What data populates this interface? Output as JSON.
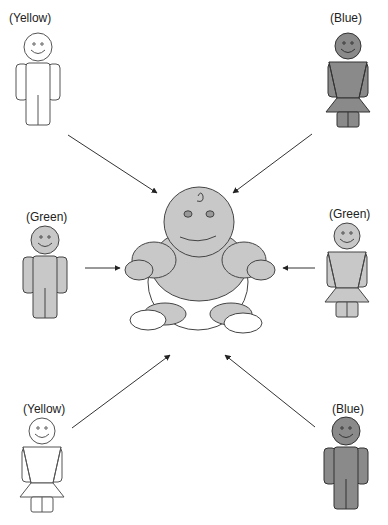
{
  "diagram": {
    "center": {
      "name": "baby",
      "description": "Central baby figure (gray)"
    },
    "figures": [
      {
        "id": "top-left",
        "label": "(Yellow)",
        "type": "male",
        "fill": "#ffffff"
      },
      {
        "id": "top-right",
        "label": "(Blue)",
        "type": "female",
        "fill": "#8a8a8a"
      },
      {
        "id": "mid-left",
        "label": "(Green)",
        "type": "male",
        "fill": "#c8c8c8"
      },
      {
        "id": "mid-right",
        "label": "(Green)",
        "type": "female",
        "fill": "#c8c8c8"
      },
      {
        "id": "bottom-left",
        "label": "(Yellow)",
        "type": "female",
        "fill": "#ffffff"
      },
      {
        "id": "bottom-right",
        "label": "(Blue)",
        "type": "male",
        "fill": "#8a8a8a"
      }
    ],
    "arrows": [
      {
        "from": "top-left",
        "to": "baby"
      },
      {
        "from": "top-right",
        "to": "baby"
      },
      {
        "from": "mid-left",
        "to": "baby"
      },
      {
        "from": "mid-right",
        "to": "baby"
      },
      {
        "from": "bottom-left",
        "to": "baby"
      },
      {
        "from": "bottom-right",
        "to": "baby"
      }
    ],
    "colors": {
      "stroke": "#333333",
      "yellow_fill": "#ffffff",
      "green_fill": "#c8c8c8",
      "blue_fill": "#8a8a8a",
      "baby_fill": "#c8c8c8"
    }
  }
}
